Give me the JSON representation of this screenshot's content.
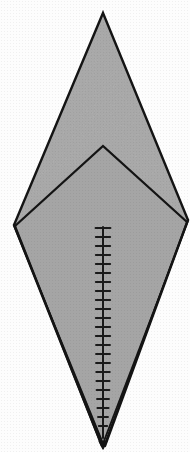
{
  "figure": {
    "caption": "",
    "canvas": {
      "width": 190,
      "height": 452
    },
    "colors": {
      "background": "#fdfdfd",
      "fill": "#a8a8a8",
      "inner_fill": "#a5a5a5",
      "stroke": "#141414",
      "midrib": "#1a1a1a"
    },
    "style": {
      "outline_stroke_width": 2.4,
      "inner_stroke_width": 2.2,
      "midrib_stroke_width": 2.0,
      "tick_stroke_width": 1.9
    }
  },
  "shapes": {
    "outer_outline": {
      "name": "outer-rhombus",
      "vertices": [
        {
          "label": "top-apex",
          "x": 103,
          "y": 13
        },
        {
          "label": "right-vertex",
          "x": 188,
          "y": 220
        },
        {
          "label": "bottom-apex",
          "x": 103,
          "y": 443
        },
        {
          "label": "left-vertex",
          "x": 14,
          "y": 225
        }
      ]
    },
    "inner_chevron": {
      "name": "inner-chevron",
      "vertices": [
        {
          "label": "chevron-apex",
          "x": 103,
          "y": 146
        },
        {
          "label": "chevron-right",
          "x": 187,
          "y": 222
        },
        {
          "label": "chevron-bottom",
          "x": 103,
          "y": 441
        },
        {
          "label": "chevron-left",
          "x": 15,
          "y": 226
        }
      ]
    },
    "secondary_edges": [
      {
        "name": "inner-left-keel",
        "points": [
          {
            "x": 15,
            "y": 226
          },
          {
            "x": 99,
            "y": 441
          }
        ]
      },
      {
        "name": "inner-right-keel",
        "points": [
          {
            "x": 187,
            "y": 222
          },
          {
            "x": 107,
            "y": 441
          }
        ]
      },
      {
        "name": "outer-left-keel",
        "points": [
          {
            "x": 14,
            "y": 225
          },
          {
            "x": 101,
            "y": 446
          }
        ]
      },
      {
        "name": "outer-right-keel",
        "points": [
          {
            "x": 188,
            "y": 220
          },
          {
            "x": 106,
            "y": 446
          }
        ]
      }
    ]
  },
  "midrib": {
    "name": "central-midrib",
    "top": {
      "x": 103,
      "y": 227
    },
    "bottom": {
      "x": 103,
      "y": 438
    },
    "tick_count": 23,
    "tick_half_width": 7,
    "tick_spacing": 9.1,
    "ticks": [
      {
        "index": 1,
        "y": 228,
        "half_width": 7.5
      },
      {
        "index": 2,
        "y": 237,
        "half_width": 7.2
      },
      {
        "index": 3,
        "y": 246,
        "half_width": 7.2
      },
      {
        "index": 4,
        "y": 255,
        "half_width": 7.2
      },
      {
        "index": 5,
        "y": 264,
        "half_width": 7.2
      },
      {
        "index": 6,
        "y": 273,
        "half_width": 7.2
      },
      {
        "index": 7,
        "y": 282,
        "half_width": 7.2
      },
      {
        "index": 8,
        "y": 291,
        "half_width": 7.2
      },
      {
        "index": 9,
        "y": 300,
        "half_width": 7.2
      },
      {
        "index": 10,
        "y": 309,
        "half_width": 7.2
      },
      {
        "index": 11,
        "y": 318,
        "half_width": 7.2
      },
      {
        "index": 12,
        "y": 327,
        "half_width": 7.2
      },
      {
        "index": 13,
        "y": 336,
        "half_width": 7.2
      },
      {
        "index": 14,
        "y": 345,
        "half_width": 7.0
      },
      {
        "index": 15,
        "y": 354,
        "half_width": 7.0
      },
      {
        "index": 16,
        "y": 363,
        "half_width": 7.0
      },
      {
        "index": 17,
        "y": 372,
        "half_width": 6.8
      },
      {
        "index": 18,
        "y": 381,
        "half_width": 6.6
      },
      {
        "index": 19,
        "y": 390,
        "half_width": 6.4
      },
      {
        "index": 20,
        "y": 399,
        "half_width": 6.0
      },
      {
        "index": 21,
        "y": 408,
        "half_width": 5.6
      },
      {
        "index": 22,
        "y": 417,
        "half_width": 5.0
      },
      {
        "index": 23,
        "y": 426,
        "half_width": 4.2
      }
    ]
  },
  "labels": {
    "visible_text": []
  }
}
